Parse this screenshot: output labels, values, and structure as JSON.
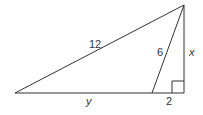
{
  "diagram": {
    "type": "geometry-right-triangle",
    "stroke_color": "#333333",
    "points": {
      "A_left": [
        15,
        93
      ],
      "B_inner": [
        152,
        93
      ],
      "C_foot": [
        184,
        93
      ],
      "D_apex": [
        184,
        5
      ]
    },
    "labels": {
      "hypotenuse": "12",
      "cevian": "6",
      "height": "x",
      "left_segment": "y",
      "right_segment": "2"
    },
    "right_angle_marker": true
  }
}
